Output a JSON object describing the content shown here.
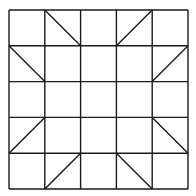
{
  "diagram": {
    "type": "quilt-block-grid",
    "rows": 5,
    "cols": 5,
    "origin": [
      9,
      10
    ],
    "cell_size": 35.8,
    "line_color": "#1a1a1a",
    "background": "#ffffff",
    "diagonals": [
      {
        "row": 0,
        "col": 1,
        "dir": "tl-br"
      },
      {
        "row": 1,
        "col": 0,
        "dir": "tl-br"
      },
      {
        "row": 0,
        "col": 3,
        "dir": "bl-tr"
      },
      {
        "row": 1,
        "col": 4,
        "dir": "bl-tr"
      },
      {
        "row": 3,
        "col": 0,
        "dir": "bl-tr"
      },
      {
        "row": 4,
        "col": 1,
        "dir": "bl-tr"
      },
      {
        "row": 3,
        "col": 4,
        "dir": "tl-br"
      },
      {
        "row": 4,
        "col": 3,
        "dir": "tl-br"
      }
    ]
  }
}
